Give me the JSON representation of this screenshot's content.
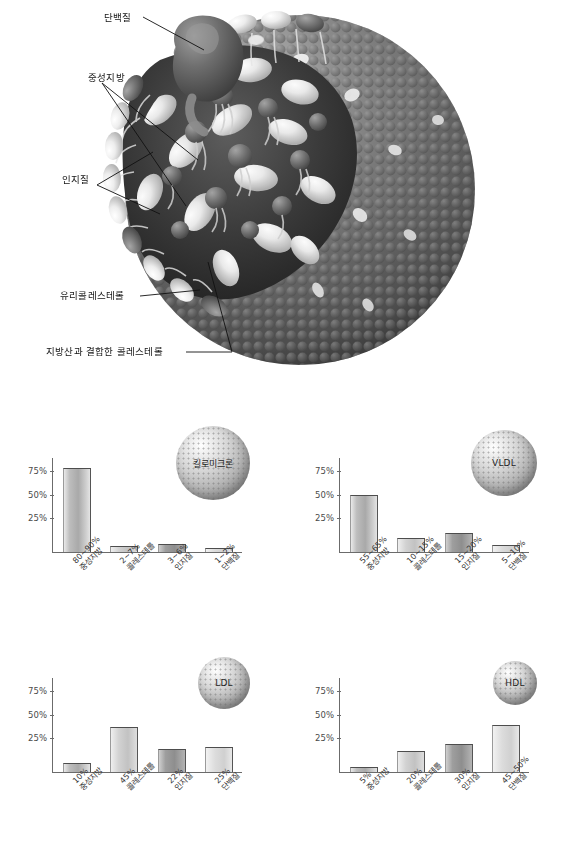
{
  "illustration": {
    "name": "lipoprotein-particle-diagram",
    "callouts": [
      {
        "id": "protein",
        "label": "단백질"
      },
      {
        "id": "triglyceride",
        "label": "중성지방"
      },
      {
        "id": "phospholipid",
        "label": "인지질"
      },
      {
        "id": "free-cholesterol",
        "label": "유리콜레스테롤"
      },
      {
        "id": "esterified-cholesterol",
        "label": "지방산과 결합한 콜레스테롤"
      }
    ]
  },
  "charts": [
    {
      "id": "chylomicron",
      "particle_label": "킬로미크론",
      "particle_size_px": 74,
      "chart_data": {
        "type": "bar",
        "title": "킬로미크론",
        "categories": [
          "중성지방",
          "콜레스테롤",
          "인지질",
          "단백질"
        ],
        "value_labels": [
          "80~90%",
          "2~7%",
          "3~6%",
          "1~2%"
        ],
        "values": [
          88,
          6,
          8,
          4
        ],
        "ylabel": "",
        "xlabel": "",
        "ylim": [
          0,
          100
        ],
        "yticks": [
          "25%",
          "50%",
          "75%"
        ],
        "ytick_values": [
          25,
          50,
          75
        ],
        "grid": false,
        "legend": "none"
      }
    },
    {
      "id": "vldl",
      "particle_label": "VLDL",
      "particle_size_px": 66,
      "chart_data": {
        "type": "bar",
        "title": "VLDL",
        "categories": [
          "중성지방",
          "콜레스테롤",
          "인지질",
          "단백질"
        ],
        "value_labels": [
          "55~65%",
          "10~15%",
          "15~20%",
          "5~10%"
        ],
        "values": [
          60,
          15,
          20,
          7
        ],
        "ylabel": "",
        "xlabel": "",
        "ylim": [
          0,
          100
        ],
        "yticks": [
          "25%",
          "50%",
          "75%"
        ],
        "ytick_values": [
          25,
          50,
          75
        ],
        "grid": false,
        "legend": "none"
      }
    },
    {
      "id": "ldl",
      "particle_label": "LDL",
      "particle_size_px": 52,
      "chart_data": {
        "type": "bar",
        "title": "LDL",
        "categories": [
          "중성지방",
          "콜레스테롤",
          "인지질",
          "단백질"
        ],
        "value_labels": [
          "10%",
          "45%",
          "22%",
          "25%"
        ],
        "values": [
          10,
          47,
          24,
          26
        ],
        "ylabel": "",
        "xlabel": "",
        "ylim": [
          0,
          100
        ],
        "yticks": [
          "25%",
          "50%",
          "75%"
        ],
        "ytick_values": [
          25,
          50,
          75
        ],
        "grid": false,
        "legend": "none"
      }
    },
    {
      "id": "hdl",
      "particle_label": "HDL",
      "particle_size_px": 44,
      "chart_data": {
        "type": "bar",
        "title": "HDL",
        "categories": [
          "중성지방",
          "콜레스테롤",
          "인지질",
          "단백질"
        ],
        "value_labels": [
          "5%",
          "20%",
          "30%",
          "45~50%"
        ],
        "values": [
          5,
          22,
          30,
          50
        ],
        "ylabel": "",
        "xlabel": "",
        "ylim": [
          0,
          100
        ],
        "yticks": [
          "25%",
          "50%",
          "75%"
        ],
        "ytick_values": [
          25,
          50,
          75
        ],
        "grid": false,
        "legend": "none"
      }
    }
  ]
}
